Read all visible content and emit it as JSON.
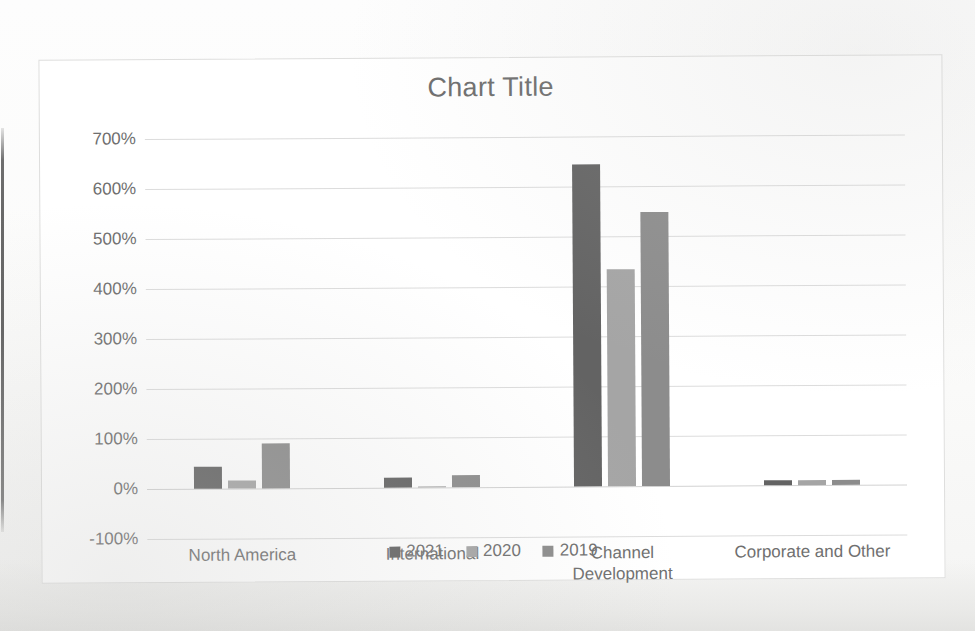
{
  "chart": {
    "title": "Chart Title",
    "legend_position": "bottom"
  },
  "chart_data": {
    "type": "bar",
    "title": "Chart Title",
    "xlabel": "",
    "ylabel": "",
    "ylim": [
      -100,
      700
    ],
    "y_tick_labels": [
      "700%",
      "600%",
      "500%",
      "400%",
      "300%",
      "200%",
      "100%",
      "0%",
      "-100%"
    ],
    "y_ticks": [
      700,
      600,
      500,
      400,
      300,
      200,
      100,
      0,
      -100
    ],
    "grid": true,
    "categories": [
      "North America",
      "International",
      "Channel\nDevelopment",
      "Corporate and Other"
    ],
    "series": [
      {
        "name": "2021",
        "color": "#636363",
        "values": [
          45,
          20,
          645,
          11
        ]
      },
      {
        "name": "2020",
        "color": "#a5a5a5",
        "values": [
          17,
          3,
          435,
          11
        ]
      },
      {
        "name": "2019",
        "color": "#8c8c8c",
        "values": [
          90,
          25,
          548,
          11
        ]
      }
    ]
  },
  "colors": {
    "series_2021": "#636363",
    "series_2020": "#a5a5a5",
    "series_2019": "#8c8c8c",
    "text": "#6f6f6f",
    "gridline": "#dcdcdc",
    "chart_border": "#dededd",
    "background": "#ffffff"
  }
}
